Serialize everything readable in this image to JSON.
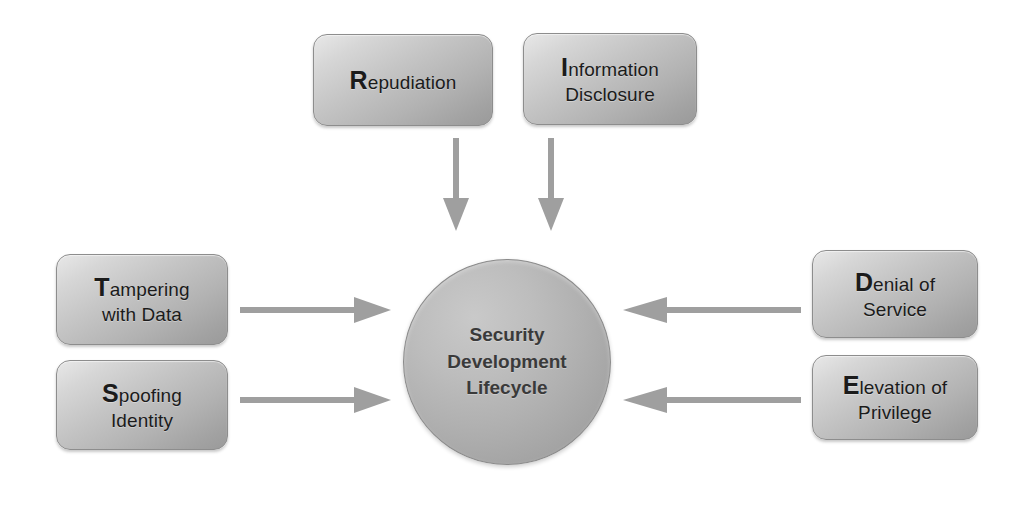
{
  "diagram": {
    "center": {
      "name": "sdl-circle",
      "line1": "Security",
      "line2": "Development",
      "line3": "Lifecycle",
      "shape": "circle",
      "fill_color": "#b0b0b0",
      "text_color": "#3a3a3a"
    },
    "boxes": [
      {
        "id": "repudiation",
        "initial": "R",
        "rest": "epudiation",
        "line2": "",
        "full_text": "Repudiation",
        "position": "top-left",
        "fill_color": "#c4c4c4"
      },
      {
        "id": "information-disclosure",
        "initial": "I",
        "rest": "nformation",
        "line2": "Disclosure",
        "full_text": "Information Disclosure",
        "position": "top-right",
        "fill_color": "#c4c4c4"
      },
      {
        "id": "tampering-with-data",
        "initial": "T",
        "rest": "ampering",
        "line2": "with Data",
        "full_text": "Tampering with Data",
        "position": "left-upper",
        "fill_color": "#c4c4c4"
      },
      {
        "id": "spoofing-identity",
        "initial": "S",
        "rest": "poofing",
        "line2": "Identity",
        "full_text": "Spoofing Identity",
        "position": "left-lower",
        "fill_color": "#c4c4c4"
      },
      {
        "id": "denial-of-service",
        "initial": "D",
        "rest": "enial of",
        "line2": "Service",
        "full_text": "Denial of Service",
        "position": "right-upper",
        "fill_color": "#c4c4c4"
      },
      {
        "id": "elevation-of-privilege",
        "initial": "E",
        "rest": "levation of",
        "line2": "Privilege",
        "full_text": "Elevation of Privilege",
        "position": "right-lower",
        "fill_color": "#c4c4c4"
      }
    ],
    "arrows": [
      {
        "id": "arrow-repudiation-down",
        "from": "repudiation",
        "to": "sdl-circle",
        "direction": "down",
        "color": "#9f9f9f"
      },
      {
        "id": "arrow-information-disclosure-down",
        "from": "information-disclosure",
        "to": "sdl-circle",
        "direction": "down",
        "color": "#9f9f9f"
      },
      {
        "id": "arrow-tampering-right",
        "from": "tampering-with-data",
        "to": "sdl-circle",
        "direction": "right",
        "color": "#9f9f9f"
      },
      {
        "id": "arrow-spoofing-right",
        "from": "spoofing-identity",
        "to": "sdl-circle",
        "direction": "right",
        "color": "#9f9f9f"
      },
      {
        "id": "arrow-denial-left",
        "from": "denial-of-service",
        "to": "sdl-circle",
        "direction": "left",
        "color": "#9f9f9f"
      },
      {
        "id": "arrow-elevation-left",
        "from": "elevation-of-privilege",
        "to": "sdl-circle",
        "direction": "left",
        "color": "#9f9f9f"
      }
    ]
  }
}
